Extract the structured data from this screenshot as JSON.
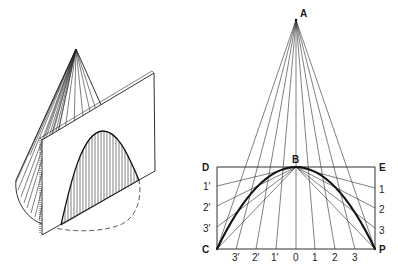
{
  "figure": {
    "left_panel": {
      "description": "Cone cut by a plane parallel to a generator, producing a parabolic section (hatched)",
      "cone": {
        "apex": [
          76,
          49
        ],
        "left_extreme": [
          16,
          182
        ]
      },
      "plane": {
        "corners": [
          [
            42,
            140
          ],
          [
            154,
            73
          ],
          [
            155,
            171
          ],
          [
            42,
            235
          ]
        ]
      },
      "section": {
        "base_left": [
          61,
          225
        ],
        "peak": [
          103,
          131
        ],
        "base_right": [
          139,
          180
        ]
      }
    },
    "right_panel": {
      "description": "Construction of a parabola by the rectangle (ordinate) method",
      "points": {
        "A": {
          "label": "A",
          "pos": [
            296,
            20
          ]
        },
        "B": {
          "label": "B",
          "pos": [
            296,
            167
          ]
        },
        "C": {
          "label": "C",
          "pos": [
            217,
            249
          ]
        },
        "D": {
          "label": "D",
          "pos": [
            217,
            167
          ]
        },
        "E": {
          "label": "E",
          "pos": [
            375,
            167
          ]
        },
        "P": {
          "label": "P",
          "pos": [
            375,
            249
          ]
        }
      },
      "bottom_labels": [
        "3′",
        "2′",
        "1′",
        "0",
        "1",
        "2",
        "3"
      ],
      "bottom_label_x": [
        236,
        256,
        275,
        296,
        315,
        335,
        355
      ],
      "left_side_labels": [
        "1′",
        "2′",
        "3′"
      ],
      "left_side_y": [
        186,
        206,
        227
      ],
      "right_side_labels": [
        "1",
        "2",
        "3"
      ],
      "right_side_y": [
        188,
        208,
        228
      ]
    }
  }
}
